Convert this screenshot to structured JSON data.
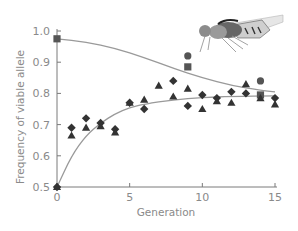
{
  "chart_data": {
    "type": "scatter",
    "title": "",
    "xlabel": "Generation",
    "ylabel": "Frequency of viable allele",
    "xlim": [
      0,
      15
    ],
    "ylim": [
      0.5,
      1.0
    ],
    "x_ticks": [
      0,
      5,
      10,
      15
    ],
    "x_tick_labels": [
      "0",
      "5",
      "10",
      "15"
    ],
    "y_ticks": [
      0.5,
      0.6,
      0.7,
      0.8,
      0.9,
      1.0
    ],
    "y_tick_labels": [
      "0.5",
      "0.6",
      "0.7",
      "0.8",
      "0.9",
      "1.0"
    ],
    "grid": false,
    "legend": null,
    "illustration": "fruit-fly",
    "series": [
      {
        "name": "Squares (starting frequency high)",
        "marker": "square",
        "points": [
          [
            0,
            0.975
          ],
          [
            9,
            0.885
          ],
          [
            14,
            0.795
          ]
        ]
      },
      {
        "name": "Circles (starting frequency high)",
        "marker": "circle",
        "points": [
          [
            9,
            0.92
          ],
          [
            14,
            0.84
          ]
        ]
      },
      {
        "name": "Diamonds (starting frequency 0.5)",
        "marker": "diamond",
        "points": [
          [
            0,
            0.5
          ],
          [
            1,
            0.69
          ],
          [
            2,
            0.72
          ],
          [
            3,
            0.705
          ],
          [
            4,
            0.685
          ],
          [
            5,
            0.77
          ],
          [
            6,
            0.75
          ],
          [
            8,
            0.84
          ],
          [
            9,
            0.76
          ],
          [
            10,
            0.795
          ],
          [
            11,
            0.785
          ],
          [
            12,
            0.805
          ],
          [
            13,
            0.8
          ],
          [
            15,
            0.785
          ]
        ]
      },
      {
        "name": "Triangles (starting frequency 0.5)",
        "marker": "triangle",
        "points": [
          [
            0,
            0.5
          ],
          [
            1,
            0.665
          ],
          [
            2,
            0.69
          ],
          [
            3,
            0.695
          ],
          [
            4,
            0.675
          ],
          [
            5,
            0.77
          ],
          [
            6,
            0.78
          ],
          [
            7,
            0.825
          ],
          [
            8,
            0.79
          ],
          [
            9,
            0.815
          ],
          [
            10,
            0.75
          ],
          [
            11,
            0.775
          ],
          [
            12,
            0.77
          ],
          [
            13,
            0.83
          ],
          [
            14,
            0.785
          ],
          [
            15,
            0.765
          ]
        ]
      }
    ],
    "fitted_curves": [
      {
        "name": "Decline from high frequency",
        "points": [
          [
            0,
            0.975
          ],
          [
            2,
            0.965
          ],
          [
            4,
            0.945
          ],
          [
            6,
            0.915
          ],
          [
            8,
            0.88
          ],
          [
            10,
            0.85
          ],
          [
            12,
            0.825
          ],
          [
            14,
            0.81
          ],
          [
            15,
            0.805
          ]
        ]
      },
      {
        "name": "Rise from 0.5",
        "points": [
          [
            0,
            0.5
          ],
          [
            1,
            0.6
          ],
          [
            2,
            0.665
          ],
          [
            3,
            0.705
          ],
          [
            4,
            0.735
          ],
          [
            5,
            0.755
          ],
          [
            6,
            0.765
          ],
          [
            8,
            0.78
          ],
          [
            10,
            0.787
          ],
          [
            12,
            0.79
          ],
          [
            15,
            0.792
          ]
        ]
      }
    ],
    "colors": {
      "axis": "#7a7a7a",
      "curve": "#9a9a9a",
      "marker": "#333333",
      "text": "#8a8a8a"
    }
  }
}
